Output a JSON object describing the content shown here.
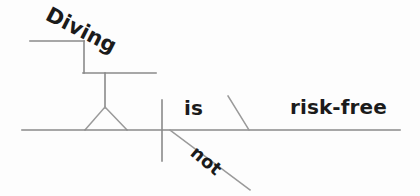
{
  "diagram": {
    "type": "reed-kellogg-sentence-diagram",
    "sentence": "Diving is not risk-free.",
    "stroke_color": "#8a8a8a",
    "text_color": "#1b1b1b",
    "background_color": "#fdfdfd",
    "labels": {
      "subject": "Diving",
      "verb": "is",
      "adverb": "not",
      "complement": "risk-free"
    },
    "roles": {
      "subject": "gerund subject",
      "verb": "linking verb",
      "adverb": "adverb modifying verb",
      "complement": "predicate adjective"
    },
    "lines": [
      {
        "name": "gerund-upper-horizontal",
        "x1": 30,
        "y1": 41,
        "x2": 84,
        "y2": 41
      },
      {
        "name": "gerund-step-vertical",
        "x1": 84,
        "y1": 41,
        "x2": 84,
        "y2": 73
      },
      {
        "name": "gerund-lower-horizontal",
        "x1": 84,
        "y1": 73,
        "x2": 156,
        "y2": 73
      },
      {
        "name": "pedestal-stem",
        "x1": 105,
        "y1": 73,
        "x2": 105,
        "y2": 107
      },
      {
        "name": "pedestal-left-leg",
        "x1": 105,
        "y1": 107,
        "x2": 85,
        "y2": 130
      },
      {
        "name": "pedestal-right-leg",
        "x1": 105,
        "y1": 107,
        "x2": 127,
        "y2": 130
      },
      {
        "name": "main-baseline",
        "x1": 22,
        "y1": 130,
        "x2": 400,
        "y2": 130
      },
      {
        "name": "subject-verb-divider",
        "x1": 162,
        "y1": 100,
        "x2": 162,
        "y2": 161
      },
      {
        "name": "adverb-slant",
        "x1": 170,
        "y1": 130,
        "x2": 250,
        "y2": 190
      },
      {
        "name": "predicate-adjective-slant",
        "x1": 228,
        "y1": 96,
        "x2": 249,
        "y2": 130
      }
    ]
  }
}
